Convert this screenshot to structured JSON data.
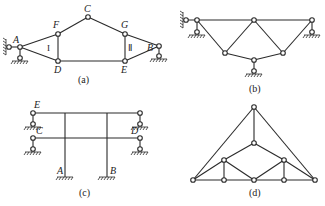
{
  "diagrams": {
    "a": {
      "caption": "(a)",
      "nodes": {
        "A": "A",
        "F": "F",
        "C": "C",
        "G": "G",
        "B": "B",
        "D": "D",
        "E": "E"
      },
      "regions": {
        "I": "I",
        "II": "Ⅱ"
      }
    },
    "b": {
      "caption": "(b)"
    },
    "c": {
      "caption": "(c)",
      "nodes": {
        "E": "E",
        "C": "C",
        "D": "D",
        "A": "A",
        "B": "B"
      }
    },
    "d": {
      "caption": "(d)"
    }
  },
  "colors": {
    "line": "#2a2a2a",
    "background": "#ffffff"
  }
}
